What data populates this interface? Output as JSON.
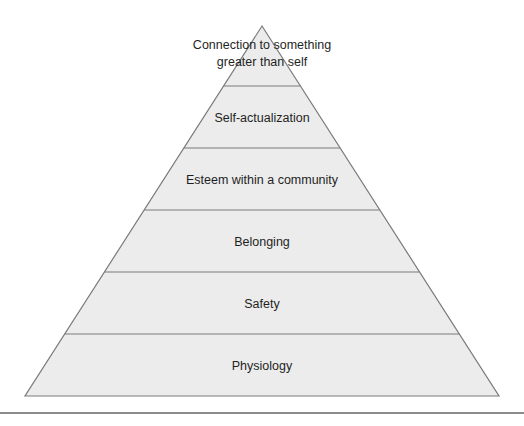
{
  "diagram": {
    "type": "pyramid",
    "colors": {
      "fill": "#ececec",
      "stroke": "#7a7a7a",
      "text": "#1f1f1f",
      "rule": "#8c8c8c"
    },
    "geometry": {
      "apex": [
        262,
        26
      ],
      "base_left": [
        25,
        396
      ],
      "base_right": [
        499,
        396
      ],
      "divider_y": [
        86,
        148,
        210,
        272,
        334
      ]
    },
    "tiers": [
      {
        "level": 6,
        "label_lines": [
          "Connection to something",
          "greater than self"
        ]
      },
      {
        "level": 5,
        "label_lines": [
          "Self-actualization"
        ]
      },
      {
        "level": 4,
        "label_lines": [
          "Esteem within a community"
        ]
      },
      {
        "level": 3,
        "label_lines": [
          "Belonging"
        ]
      },
      {
        "level": 2,
        "label_lines": [
          "Safety"
        ]
      },
      {
        "level": 1,
        "label_lines": [
          "Physiology"
        ]
      }
    ]
  }
}
